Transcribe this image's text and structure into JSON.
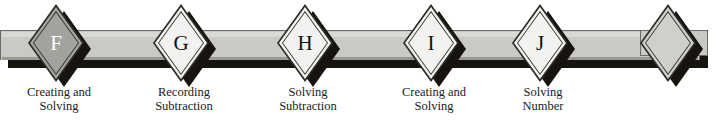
{
  "diagram": {
    "type": "timeline-band",
    "band_color": "#c9c9c5",
    "shadow_color": "#17140f",
    "nodes": [
      {
        "letter": "F",
        "style": "filled",
        "caption_line1": "Creating and",
        "caption_line2": "Solving",
        "caption_line3": ""
      },
      {
        "letter": "G",
        "style": "light",
        "caption_line1": "Recording",
        "caption_line2": "Subtraction",
        "caption_line3": ""
      },
      {
        "letter": "H",
        "style": "light",
        "caption_line1": "Solving",
        "caption_line2": "Subtraction",
        "caption_line3": ""
      },
      {
        "letter": "I",
        "style": "light",
        "caption_line1": "Creating and",
        "caption_line2": "Solving",
        "caption_line3": "..."
      },
      {
        "letter": "J",
        "style": "light",
        "caption_line1": "Solving",
        "caption_line2": "Number",
        "caption_line3": "..."
      },
      {
        "letter": "",
        "style": "gray",
        "caption_line1": "",
        "caption_line2": "",
        "caption_line3": ""
      }
    ]
  }
}
